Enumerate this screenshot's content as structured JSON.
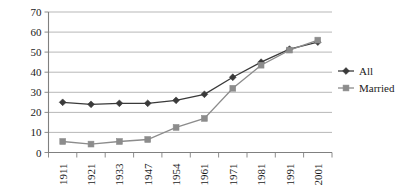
{
  "chart_data": {
    "type": "line",
    "title": "",
    "xlabel": "",
    "ylabel": "",
    "categories": [
      "1911",
      "1921",
      "1933",
      "1947",
      "1954",
      "1961",
      "1971",
      "1981",
      "1991",
      "2001"
    ],
    "ylim": [
      0,
      70
    ],
    "ytick_values": [
      "0",
      "10",
      "20",
      "30",
      "40",
      "50",
      "60",
      "70"
    ],
    "grid": true,
    "legend_position": "right",
    "series": [
      {
        "name": "All",
        "color": "#3a3a3a",
        "marker": "diamond",
        "values": [
          25,
          24,
          24.5,
          24.5,
          26,
          29,
          37.5,
          45,
          51.5,
          55
        ]
      },
      {
        "name": "Married",
        "color": "#8c8c8c",
        "marker": "square",
        "values": [
          5.5,
          4.2,
          5.5,
          6.5,
          12.5,
          17,
          32,
          43.5,
          51,
          56
        ]
      }
    ]
  },
  "legend": {
    "items": [
      {
        "label": "All"
      },
      {
        "label": "Married"
      }
    ]
  }
}
